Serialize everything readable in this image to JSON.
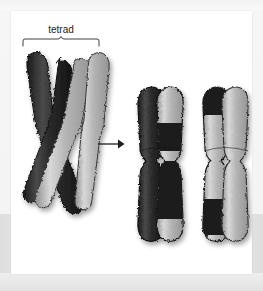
{
  "figure": {
    "label": "tetrad",
    "arrow": "→",
    "colors": {
      "dark_chromatid": "#262626",
      "light_chromatid": "#b9b9b9",
      "outline": "#1a1a1a",
      "panel_background": "#ffffff",
      "page_background": "#f2f2f2",
      "label_color": "#1c1c1c"
    },
    "stages": [
      {
        "name": "tetrad-with-crossover",
        "label": "tetrad",
        "chromatid_count": 4,
        "description": "Four chromatids of a tetrad crossing over at a chiasma",
        "chromatids": [
          {
            "name": "chromatid-1",
            "shade": "dark"
          },
          {
            "name": "chromatid-2",
            "shade": "dark"
          },
          {
            "name": "chromatid-3",
            "shade": "light"
          },
          {
            "name": "chromatid-4",
            "shade": "light"
          }
        ]
      },
      {
        "name": "recombinant-chromosome-left",
        "label": "",
        "chromatid_count": 2,
        "description": "Chromosome with one fully dark chromatid and one recombinant chromatid",
        "chromatids": [
          {
            "name": "chromatid-1",
            "shade": "dark"
          },
          {
            "name": "chromatid-2",
            "shade": "light-with-dark-bands"
          }
        ]
      },
      {
        "name": "recombinant-chromosome-right",
        "label": "",
        "chromatid_count": 2,
        "description": "Chromosome with one recombinant chromatid and one fully light chromatid",
        "chromatids": [
          {
            "name": "chromatid-1",
            "shade": "light-with-dark-bands"
          },
          {
            "name": "chromatid-2",
            "shade": "light"
          }
        ]
      }
    ]
  }
}
